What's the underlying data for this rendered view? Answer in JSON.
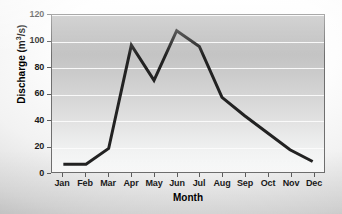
{
  "chart_data": {
    "type": "line",
    "title": "",
    "subtitle": "",
    "xlabel": "Month",
    "ylabel": "Discharge (m3/s)",
    "ylabel_parts": {
      "text_before": "Discharge (m",
      "superscript": "3",
      "text_after": "/s)"
    },
    "categories": [
      "Jan",
      "Feb",
      "Mar",
      "Apr",
      "May",
      "Jun",
      "Jul",
      "Aug",
      "Sep",
      "Oct",
      "Nov",
      "Dec"
    ],
    "values": [
      6,
      6,
      18,
      97,
      70,
      108,
      96,
      57,
      43,
      30,
      17,
      8
    ],
    "series": [
      {
        "name": "Discharge",
        "values": [
          6,
          6,
          18,
          97,
          70,
          108,
          96,
          57,
          43,
          30,
          17,
          8
        ]
      }
    ],
    "ylim": [
      0,
      120
    ],
    "yticks": [
      0,
      20,
      40,
      60,
      80,
      100,
      120
    ],
    "ytick_labels": [
      "0",
      "20",
      "40",
      "60",
      "80",
      "100",
      "120"
    ],
    "xtick_labels": [
      "Jan",
      "Feb",
      "Mar",
      "Apr",
      "May",
      "Jun",
      "Jul",
      "Aug",
      "Sep",
      "Oct",
      "Nov",
      "Dec"
    ],
    "grid": true,
    "grid_axis": "y",
    "grid_color": "#fbfbfb",
    "legend": false,
    "legend_position": "none",
    "line_color": "#222222",
    "line_width": 3,
    "markers": false,
    "plot_background": "vertical gradient gray to white",
    "figure_background": "#e8e8e8",
    "annotations": []
  }
}
